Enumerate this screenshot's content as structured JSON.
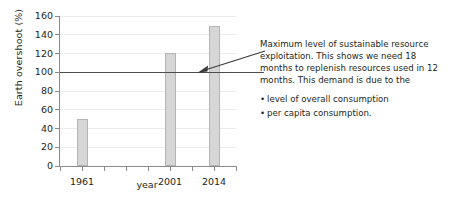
{
  "chart_data": {
    "type": "bar",
    "title": "",
    "xlabel": "year",
    "ylabel": "Earth overshoot (%)",
    "categories": [
      "1961",
      "2001",
      "2014"
    ],
    "values": [
      50,
      121,
      149
    ],
    "ylim": [
      0,
      160
    ],
    "yticks": [
      0,
      20,
      40,
      60,
      80,
      100,
      120,
      140,
      160
    ],
    "ytick_labels": [
      "0",
      "20",
      "40",
      "60",
      "80",
      "100",
      "120",
      "140",
      "160"
    ],
    "xtick_count": 9,
    "grid": true,
    "legend": "none",
    "bar_color": "#d6d6d6",
    "bar_edge_color": "#b4b4b4",
    "axis_color": "#8a8a8a",
    "grid_color": "#ececec",
    "reference_line": {
      "value": 100,
      "color": "#4d4d4d",
      "label": "Maximum level of sustainable resource exploitation"
    }
  },
  "annotation": {
    "paragraph": "Maximum level of sustainable resource exploitation. This shows we need 18 months to replenish resources used in 12 months. This demand is due to the",
    "bullets": [
      "level of overall consumption",
      "per capita consumption."
    ]
  }
}
